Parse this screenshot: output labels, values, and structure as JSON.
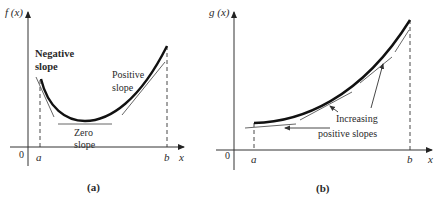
{
  "panels": [
    {
      "id": "a",
      "caption": "(a)",
      "y_label": "f (x)",
      "x_label": "x",
      "origin_label": "0",
      "a_label": "a",
      "b_label": "b",
      "annotations": {
        "negative_line1": "Negative",
        "negative_line2": "slope",
        "zero_line1": "Zero",
        "zero_line2": "slope",
        "positive_line1": "Positive",
        "positive_line2": "slope"
      }
    },
    {
      "id": "b",
      "caption": "(b)",
      "y_label": "g (x)",
      "x_label": "x",
      "origin_label": "0",
      "a_label": "a",
      "b_label": "b",
      "annotations": {
        "increasing_line1": "Increasing",
        "increasing_line2": "positive slopes"
      }
    }
  ],
  "colors": {
    "curve": "#111111",
    "axis": "#333333",
    "tangent": "#555555",
    "text": "#2a2a2a"
  }
}
